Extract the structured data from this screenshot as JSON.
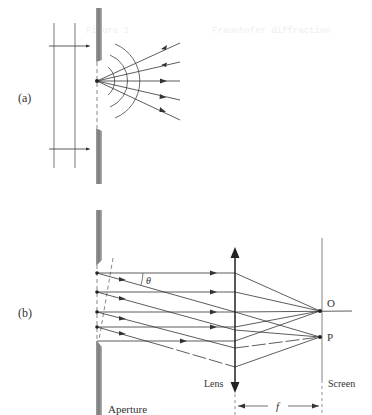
{
  "figure": {
    "colors": {
      "line": "#3a3a3a",
      "plate_light": "#b8b8b8",
      "plate_dark": "#6e6e6e",
      "ghost_text": "#eeeeee"
    }
  },
  "panel_a": {
    "label": "(a)",
    "description": "Plane wave incident on an aperture; point in aperture emits spherical wavelets with diverging rays",
    "ray_count": 5,
    "wavefront_arc_count": 3
  },
  "panel_b": {
    "label": "(b)",
    "labels": {
      "theta": "θ",
      "point_o": "O",
      "point_p": "P",
      "lens": "Lens",
      "screen": "Screen",
      "aperture": "Aperture",
      "focal_length": "f"
    },
    "source_point_count": 4
  },
  "ghost_text": {
    "left": "Figure 1",
    "right": "Fraunhofer diffraction"
  }
}
